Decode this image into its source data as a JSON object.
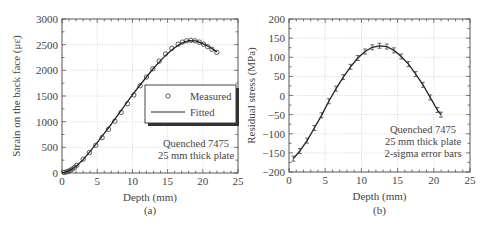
{
  "chart_data": [
    {
      "id": "a",
      "type": "scatter",
      "caption": "(a)",
      "title": "",
      "xlabel": "Depth (mm)",
      "ylabel": "Strain on the back face (με)",
      "xlim": [
        0,
        25
      ],
      "ylim": [
        0,
        3000
      ],
      "xticks": [
        0,
        5,
        10,
        15,
        20,
        25
      ],
      "yticks": [
        0,
        500,
        1000,
        1500,
        2000,
        2500,
        3000
      ],
      "grid": true,
      "legend": {
        "position": "center-right",
        "entries": [
          "Measured",
          "Fitted"
        ]
      },
      "annotation": [
        "Quenched 7475",
        "25 mm thick plate"
      ],
      "series": [
        {
          "name": "Measured",
          "style": "open-circle",
          "x": [
            0.3,
            0.6,
            0.9,
            1.2,
            1.5,
            1.8,
            2.1,
            3.0,
            3.9,
            4.8,
            5.7,
            6.6,
            7.5,
            8.4,
            9.3,
            10.2,
            11.1,
            12.0,
            12.9,
            13.8,
            14.7,
            15.6,
            16.5,
            17.1,
            17.7,
            18.3,
            18.9,
            19.5,
            20.1,
            20.7,
            21.3,
            22.0
          ],
          "y": [
            10,
            20,
            35,
            55,
            80,
            110,
            150,
            270,
            400,
            540,
            690,
            850,
            1010,
            1180,
            1350,
            1520,
            1700,
            1870,
            2030,
            2180,
            2320,
            2430,
            2510,
            2550,
            2575,
            2585,
            2575,
            2550,
            2510,
            2460,
            2410,
            2350
          ]
        },
        {
          "name": "Fitted",
          "style": "line",
          "x": [
            0,
            1,
            2,
            3,
            4,
            5,
            6,
            7,
            8,
            9,
            10,
            11,
            12,
            13,
            14,
            15,
            16,
            17,
            18,
            19,
            20,
            21,
            22
          ],
          "y": [
            0,
            40,
            130,
            260,
            420,
            590,
            770,
            950,
            1140,
            1330,
            1520,
            1700,
            1870,
            2040,
            2190,
            2330,
            2440,
            2530,
            2580,
            2575,
            2520,
            2450,
            2360
          ]
        }
      ]
    },
    {
      "id": "b",
      "type": "line",
      "caption": "(b)",
      "title": "",
      "xlabel": "Depth (mm)",
      "ylabel": "Residual stress (MPa)",
      "xlim": [
        0,
        25
      ],
      "ylim": [
        -200,
        200
      ],
      "xticks": [
        0,
        5,
        10,
        15,
        20,
        25
      ],
      "yticks": [
        -200,
        -150,
        -100,
        -50,
        0,
        50,
        100,
        150,
        200
      ],
      "grid": true,
      "annotation": [
        "Quenched 7475",
        "25 mm thick plate",
        "2-sigma error bars"
      ],
      "series": [
        {
          "name": "Residual stress",
          "style": "line-with-error-bars",
          "x": [
            0.6,
            1.5,
            2.5,
            3.5,
            4.5,
            5.5,
            6.5,
            7.5,
            8.5,
            9.5,
            10.5,
            11.5,
            12.5,
            13.5,
            14.5,
            15.5,
            16.5,
            17.5,
            18.5,
            19.5,
            20.5,
            21.0
          ],
          "y": [
            -165,
            -145,
            -118,
            -85,
            -52,
            -15,
            18,
            48,
            75,
            98,
            115,
            126,
            130,
            128,
            118,
            102,
            82,
            56,
            28,
            -5,
            -38,
            -50
          ]
        }
      ]
    }
  ]
}
